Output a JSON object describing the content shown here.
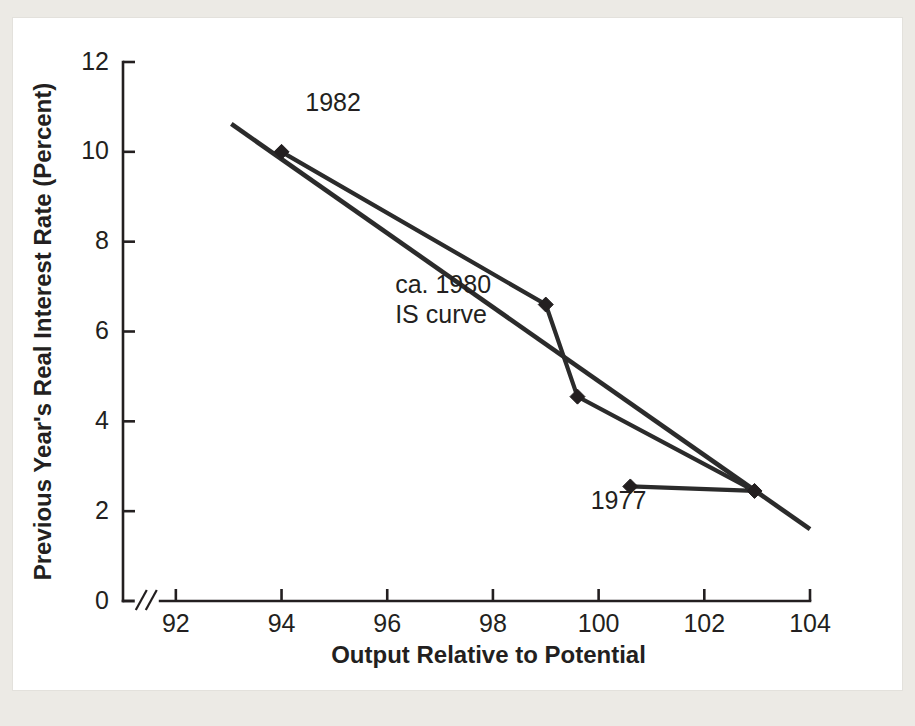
{
  "figure": {
    "background_color": "#eceae5",
    "card_color": "#ffffff",
    "ink_color": "#231f20"
  },
  "chart_data": {
    "type": "line",
    "title": "",
    "subtitle": "",
    "xlabel": "Output Relative to Potential",
    "ylabel": "Previous Year's Real Interest Rate (Percent)",
    "xlim": [
      91.0,
      104.0
    ],
    "ylim": [
      0,
      12
    ],
    "xticks": [
      92,
      94,
      96,
      98,
      100,
      102,
      104
    ],
    "xtick_labels": [
      "92",
      "94",
      "96",
      "98",
      "100",
      "102",
      "104"
    ],
    "yticks": [
      0,
      2,
      4,
      6,
      8,
      10,
      12
    ],
    "ytick_labels": [
      "0",
      "2",
      "4",
      "6",
      "8",
      "10",
      "12"
    ],
    "grid": false,
    "legend": "none",
    "axis_break": {
      "present": true,
      "axis": "x",
      "symbol": "//",
      "at_value": 91.45
    },
    "series": [
      {
        "name": "data-path",
        "style": "line-with-diamond-markers",
        "markers": true,
        "color": "#2b2b2b",
        "points": [
          {
            "x": 94.0,
            "y": 10.0,
            "label": "1982"
          },
          {
            "x": 99.0,
            "y": 6.6,
            "label": ""
          },
          {
            "x": 99.6,
            "y": 4.55,
            "label": ""
          },
          {
            "x": 102.95,
            "y": 2.45,
            "label": ""
          },
          {
            "x": 100.6,
            "y": 2.55,
            "label": "1977"
          }
        ]
      },
      {
        "name": "ca. 1980 IS curve",
        "style": "straight-line-no-markers",
        "markers": false,
        "color": "#2b2b2b",
        "points": [
          {
            "x": 93.05,
            "y": 10.62
          },
          {
            "x": 104.0,
            "y": 1.6
          }
        ]
      }
    ],
    "annotations": [
      {
        "id": "label-1982",
        "text": "1982",
        "x": 94.45,
        "y": 10.9,
        "anchor": "start"
      },
      {
        "id": "label-1977",
        "text": "1977",
        "x": 99.85,
        "y": 2.05,
        "anchor": "start"
      },
      {
        "id": "label-is-curve-line1",
        "text": "ca. 1980",
        "x": 96.15,
        "y": 6.85,
        "anchor": "start"
      },
      {
        "id": "label-is-curve-line2",
        "text": "IS curve",
        "x": 96.15,
        "y": 6.2,
        "anchor": "start"
      }
    ]
  }
}
